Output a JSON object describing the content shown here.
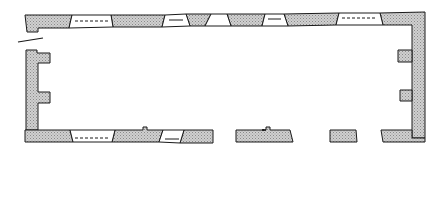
{
  "rooms": {
    "hall_kitchen": "hall (kitchen)",
    "pantry": "pantry",
    "buttery": "buttery",
    "parlour": "parlour",
    "entrance_hall": "entrance hall"
  },
  "caption": {
    "line1": "Four roomed symmetrical plan  (two",
    "line2": "unheated service rooms)"
  },
  "scale": {
    "label": "Scale of feet",
    "ticks": [
      "0",
      "10",
      "20"
    ],
    "unit": "feet",
    "max": 20
  },
  "colors": {
    "ink": "#1a1a1a",
    "hatch": "#bdbdbd",
    "background": "#ffffff"
  }
}
